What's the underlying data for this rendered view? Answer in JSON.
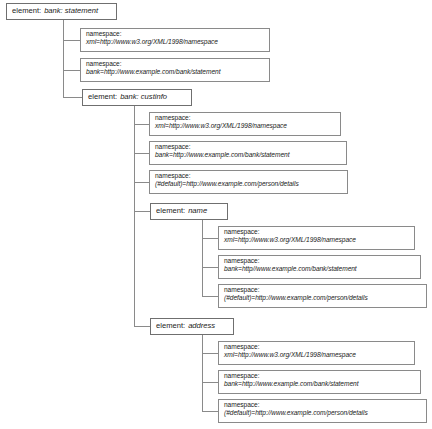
{
  "diagram": {
    "background_color": "#ffffff",
    "line_color": "#8a8a8a",
    "text_color": "#1a1a1a",
    "labels": {
      "element_prefix": "element:",
      "namespace_prefix": "namespace:"
    }
  },
  "nodes": [
    {
      "id": "root-element",
      "type": "element",
      "kind": "element:",
      "name": "bank: statement",
      "x": 6,
      "y": 3,
      "w": 111,
      "h": 17
    },
    {
      "id": "root-ns-xml",
      "type": "namespace",
      "kind": "namespace:",
      "binding": "xml=http://www.w3.org/XML/1998/namespace",
      "x": 80,
      "y": 28,
      "w": 190,
      "h": 24
    },
    {
      "id": "root-ns-bank",
      "type": "namespace",
      "kind": "namespace:",
      "binding": "bank=http://www.example.com/bank/statement",
      "x": 80,
      "y": 58,
      "w": 190,
      "h": 24
    },
    {
      "id": "custinfo-element",
      "type": "element",
      "kind": "element:",
      "name": "bank: custinfo",
      "x": 82,
      "y": 89,
      "w": 110,
      "h": 17
    },
    {
      "id": "custinfo-ns-xml",
      "type": "namespace",
      "kind": "namespace:",
      "binding": "xml=http://www.w3.org/XML/1998/namespace",
      "x": 149,
      "y": 112,
      "w": 192,
      "h": 24
    },
    {
      "id": "custinfo-ns-bank",
      "type": "namespace",
      "kind": "namespace:",
      "binding": "bank=http://www.example.com/bank/statement",
      "x": 149,
      "y": 141,
      "w": 198,
      "h": 24
    },
    {
      "id": "custinfo-ns-default",
      "type": "namespace",
      "kind": "namespace:",
      "binding": "(#default)=http://www.example.com/person/details",
      "x": 149,
      "y": 170,
      "w": 199,
      "h": 24
    },
    {
      "id": "name-element",
      "type": "element",
      "kind": "element:",
      "name": "name",
      "x": 150,
      "y": 203,
      "w": 78,
      "h": 17
    },
    {
      "id": "name-ns-xml",
      "type": "namespace",
      "kind": "namespace:",
      "binding": "xml=http://www.w3.org/XML/1998/namespace",
      "x": 218,
      "y": 226,
      "w": 197,
      "h": 24
    },
    {
      "id": "name-ns-bank",
      "type": "namespace",
      "kind": "namespace:",
      "binding": "bank=http//www.example.com/bank/statement",
      "x": 218,
      "y": 255,
      "w": 203,
      "h": 24
    },
    {
      "id": "name-ns-default",
      "type": "namespace",
      "kind": "namespace:",
      "binding": "(#default)=http://www.example.com/person/details",
      "x": 218,
      "y": 284,
      "w": 209,
      "h": 24
    },
    {
      "id": "address-element",
      "type": "element",
      "kind": "element:",
      "name": "address",
      "x": 150,
      "y": 318,
      "w": 84,
      "h": 17
    },
    {
      "id": "address-ns-xml",
      "type": "namespace",
      "kind": "namespace:",
      "binding": "xml=http://www.w3.org/XML/1998/namespace",
      "x": 218,
      "y": 341,
      "w": 197,
      "h": 24
    },
    {
      "id": "address-ns-bank",
      "type": "namespace",
      "kind": "namespace:",
      "binding": "bank=http://www.example.com/bank/statement",
      "x": 218,
      "y": 370,
      "w": 203,
      "h": 24
    },
    {
      "id": "address-ns-default",
      "type": "namespace",
      "kind": "namespace:",
      "binding": "(#default)=http://www.example.com/person/details",
      "x": 218,
      "y": 399,
      "w": 209,
      "h": 24
    }
  ],
  "connectors": [
    {
      "id": "trunk-root",
      "x": 63,
      "y1": 20,
      "y2": 97
    },
    {
      "id": "stub-root-1",
      "y": 40,
      "x1": 63,
      "x2": 80
    },
    {
      "id": "stub-root-2",
      "y": 70,
      "x1": 63,
      "x2": 80
    },
    {
      "id": "stub-root-3",
      "y": 97,
      "x1": 63,
      "x2": 82
    },
    {
      "id": "trunk-custinfo",
      "x": 134,
      "y1": 106,
      "y2": 326
    },
    {
      "id": "stub-cust-1",
      "y": 124,
      "x1": 134,
      "x2": 149
    },
    {
      "id": "stub-cust-2",
      "y": 153,
      "x1": 134,
      "x2": 149
    },
    {
      "id": "stub-cust-3",
      "y": 182,
      "x1": 134,
      "x2": 149
    },
    {
      "id": "stub-cust-4",
      "y": 211,
      "x1": 134,
      "x2": 150
    },
    {
      "id": "stub-cust-5",
      "y": 326,
      "x1": 134,
      "x2": 150
    },
    {
      "id": "trunk-name",
      "x": 202,
      "y1": 220,
      "y2": 296
    },
    {
      "id": "stub-name-1",
      "y": 238,
      "x1": 202,
      "x2": 218
    },
    {
      "id": "stub-name-2",
      "y": 267,
      "x1": 202,
      "x2": 218
    },
    {
      "id": "stub-name-3",
      "y": 296,
      "x1": 202,
      "x2": 218
    },
    {
      "id": "trunk-address",
      "x": 202,
      "y1": 335,
      "y2": 411
    },
    {
      "id": "stub-addr-1",
      "y": 353,
      "x1": 202,
      "x2": 218
    },
    {
      "id": "stub-addr-2",
      "y": 382,
      "x1": 202,
      "x2": 218
    },
    {
      "id": "stub-addr-3",
      "y": 411,
      "x1": 202,
      "x2": 218
    }
  ]
}
